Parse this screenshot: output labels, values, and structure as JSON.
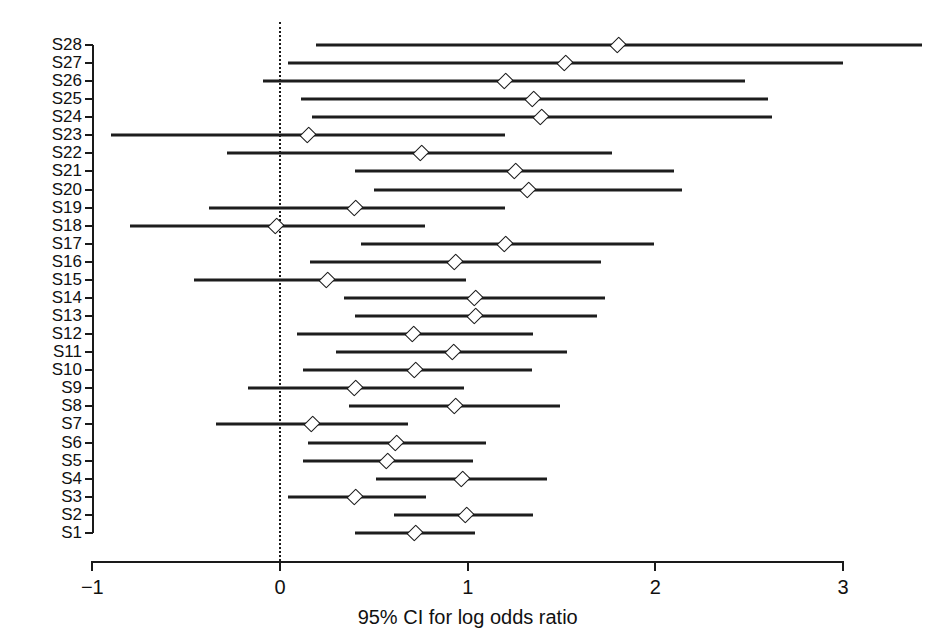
{
  "chart_data": {
    "type": "scatter",
    "subtype": "forest-plot",
    "title": "",
    "xlabel": "95% CI for log odds ratio",
    "ylabel": "",
    "xlim": [
      -1,
      3.5
    ],
    "ylim": [
      0.5,
      28.5
    ],
    "xticks": [
      -1,
      0,
      1,
      2,
      3
    ],
    "xtick_labels": [
      "−1",
      "0",
      "1",
      "2",
      "3"
    ],
    "grid": false,
    "legend": null,
    "reference_line": {
      "x": 0,
      "style": "dotted"
    },
    "categories": [
      "S28",
      "S27",
      "S26",
      "S25",
      "S24",
      "S23",
      "S22",
      "S21",
      "S20",
      "S19",
      "S18",
      "S17",
      "S16",
      "S15",
      "S14",
      "S13",
      "S12",
      "S11",
      "S10",
      "S9",
      "S8",
      "S7",
      "S6",
      "S5",
      "S4",
      "S3",
      "S2",
      "S1"
    ],
    "points": [
      {
        "label": "S28",
        "estimate": 1.8,
        "ci_low": 0.19,
        "ci_high": 3.42
      },
      {
        "label": "S27",
        "estimate": 1.52,
        "ci_low": 0.04,
        "ci_high": 3.0
      },
      {
        "label": "S26",
        "estimate": 1.2,
        "ci_low": -0.09,
        "ci_high": 2.48
      },
      {
        "label": "S25",
        "estimate": 1.35,
        "ci_low": 0.11,
        "ci_high": 2.6
      },
      {
        "label": "S24",
        "estimate": 1.39,
        "ci_low": 0.17,
        "ci_high": 2.62
      },
      {
        "label": "S23",
        "estimate": 0.15,
        "ci_low": -0.9,
        "ci_high": 1.2
      },
      {
        "label": "S22",
        "estimate": 0.75,
        "ci_low": -0.28,
        "ci_high": 1.77
      },
      {
        "label": "S21",
        "estimate": 1.25,
        "ci_low": 0.4,
        "ci_high": 2.1
      },
      {
        "label": "S20",
        "estimate": 1.32,
        "ci_low": 0.5,
        "ci_high": 2.14
      },
      {
        "label": "S19",
        "estimate": 0.4,
        "ci_low": -0.38,
        "ci_high": 1.2
      },
      {
        "label": "S18",
        "estimate": -0.02,
        "ci_low": -0.8,
        "ci_high": 0.77
      },
      {
        "label": "S17",
        "estimate": 1.2,
        "ci_low": 0.43,
        "ci_high": 1.99
      },
      {
        "label": "S16",
        "estimate": 0.93,
        "ci_low": 0.16,
        "ci_high": 1.71
      },
      {
        "label": "S15",
        "estimate": 0.25,
        "ci_low": -0.46,
        "ci_high": 0.99
      },
      {
        "label": "S14",
        "estimate": 1.04,
        "ci_low": 0.34,
        "ci_high": 1.73
      },
      {
        "label": "S13",
        "estimate": 1.04,
        "ci_low": 0.4,
        "ci_high": 1.69
      },
      {
        "label": "S12",
        "estimate": 0.71,
        "ci_low": 0.09,
        "ci_high": 1.35
      },
      {
        "label": "S11",
        "estimate": 0.92,
        "ci_low": 0.3,
        "ci_high": 1.53
      },
      {
        "label": "S10",
        "estimate": 0.72,
        "ci_low": 0.12,
        "ci_high": 1.34
      },
      {
        "label": "S9",
        "estimate": 0.4,
        "ci_low": -0.17,
        "ci_high": 0.98
      },
      {
        "label": "S8",
        "estimate": 0.93,
        "ci_low": 0.37,
        "ci_high": 1.49
      },
      {
        "label": "S7",
        "estimate": 0.17,
        "ci_low": -0.34,
        "ci_high": 0.68
      },
      {
        "label": "S6",
        "estimate": 0.62,
        "ci_low": 0.15,
        "ci_high": 1.1
      },
      {
        "label": "S5",
        "estimate": 0.57,
        "ci_low": 0.12,
        "ci_high": 1.03
      },
      {
        "label": "S4",
        "estimate": 0.97,
        "ci_low": 0.51,
        "ci_high": 1.42
      },
      {
        "label": "S3",
        "estimate": 0.4,
        "ci_low": 0.04,
        "ci_high": 0.78
      },
      {
        "label": "S2",
        "estimate": 0.99,
        "ci_low": 0.61,
        "ci_high": 1.35
      },
      {
        "label": "S1",
        "estimate": 0.72,
        "ci_low": 0.4,
        "ci_high": 1.04
      }
    ]
  },
  "colors": {
    "line": "#1d1d1d",
    "axis": "#1a1a1a",
    "marker_face": "#ffffff",
    "marker_edge": "#1d1d1d",
    "background": "#ffffff",
    "text": "#111111"
  }
}
